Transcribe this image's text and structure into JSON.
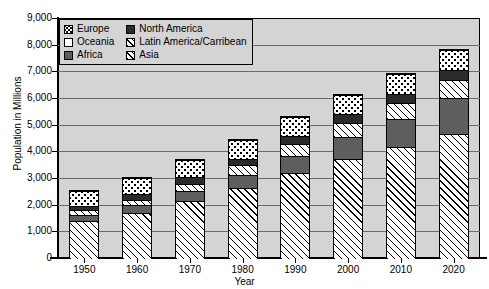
{
  "chart_data": {
    "type": "bar",
    "subtype": "stacked-bar",
    "title": "",
    "xlabel": "Year",
    "ylabel": "Population in Millions",
    "categories": [
      "1950",
      "1960",
      "1970",
      "1980",
      "1990",
      "2000",
      "2010",
      "2020"
    ],
    "ylim": [
      0,
      9000
    ],
    "ytick_step": 1000,
    "yticks": [
      "0",
      "1,000",
      "2,000",
      "3,000",
      "4,000",
      "5,000",
      "6,000",
      "7,000",
      "8,000",
      "9,000"
    ],
    "grid": true,
    "legend_position": "top-left",
    "stack_order_bottom_to_top": [
      "Asia",
      "Africa",
      "Latin America/Carribean",
      "North America",
      "Europe",
      "Oceania"
    ],
    "series": [
      {
        "name": "Asia",
        "values": [
          1400,
          1700,
          2140,
          2640,
          3200,
          3730,
          4180,
          4650
        ]
      },
      {
        "name": "Africa",
        "values": [
          230,
          285,
          365,
          480,
          635,
          820,
          1040,
          1350
        ]
      },
      {
        "name": "Latin America/Carribean",
        "values": [
          170,
          220,
          290,
          365,
          445,
          525,
          600,
          660
        ]
      },
      {
        "name": "North America",
        "values": [
          175,
          205,
          230,
          255,
          285,
          315,
          345,
          375
        ]
      },
      {
        "name": "Europe",
        "values": [
          550,
          605,
          655,
          695,
          720,
          730,
          735,
          750
        ]
      },
      {
        "name": "Oceania",
        "values": [
          13,
          16,
          20,
          23,
          27,
          31,
          37,
          43
        ]
      }
    ],
    "totals": [
      2538,
      3031,
      3700,
      4458,
      5312,
      6151,
      6937,
      7828
    ],
    "colors": {
      "Asia": "#ffffff",
      "Africa": "#5e5e5e",
      "Latin America/Carribean": "#ffffff",
      "North America": "#2b2b2b",
      "Europe": "#ffffff",
      "Oceania": "#ffffff",
      "plot_background": "#d4d4d4",
      "gridline": "#6b6b6b",
      "axis": "#000000"
    },
    "patterns": {
      "Asia": "diagonal-hatch",
      "Africa": "solid-gray",
      "Latin America/Carribean": "diagonal-hatch",
      "North America": "solid-dark",
      "Europe": "dotted",
      "Oceania": "empty-white"
    }
  },
  "legend": {
    "items": [
      {
        "label": "Europe",
        "swatch": "europe-swatch"
      },
      {
        "label": "North America",
        "swatch": "north-america-swatch"
      },
      {
        "label": "Oceania",
        "swatch": "oceania-swatch"
      },
      {
        "label": "Latin America/Carribean",
        "swatch": "latin-america-swatch"
      },
      {
        "label": "Africa",
        "swatch": "africa-swatch"
      },
      {
        "label": "Asia",
        "swatch": "asia-swatch"
      }
    ]
  }
}
